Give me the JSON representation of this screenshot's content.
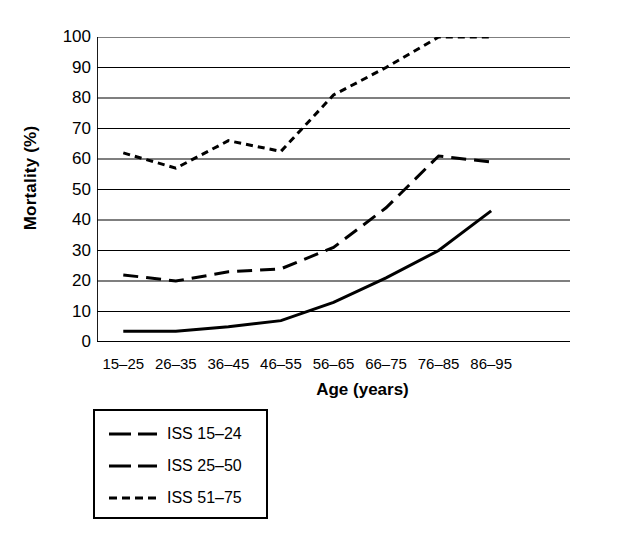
{
  "chart_data": {
    "type": "line",
    "title": "",
    "xlabel": "Age (years)",
    "ylabel": "Mortality (%)",
    "categories": [
      "15–25",
      "26–35",
      "36–45",
      "46–55",
      "56–65",
      "66–75",
      "76–85",
      "86–95"
    ],
    "ylim": [
      0,
      100
    ],
    "ytick_labels": [
      "0",
      "10",
      "20",
      "30",
      "40",
      "50",
      "60",
      "70",
      "80",
      "90",
      "100"
    ],
    "ytick_values": [
      0,
      10,
      20,
      30,
      40,
      50,
      60,
      70,
      80,
      90,
      100
    ],
    "grid": "horizontal",
    "legend_position": "below-left",
    "series": [
      {
        "name": "ISS 15–24",
        "style": "solid",
        "color": "#000000",
        "values": [
          3.5,
          3.5,
          5,
          7,
          13,
          21,
          30,
          43
        ]
      },
      {
        "name": "ISS 25–50",
        "style": "dashed",
        "color": "#000000",
        "values": [
          22,
          20,
          23,
          24,
          31,
          44,
          61,
          59
        ]
      },
      {
        "name": "ISS 51–75",
        "style": "dotted",
        "color": "#000000",
        "values": [
          62,
          57,
          66,
          62.5,
          81,
          90,
          100,
          100
        ]
      }
    ]
  },
  "axes": {
    "y_title": "Mortality (%)",
    "x_title": "Age (years)"
  },
  "legend": {
    "entries": [
      {
        "label": "ISS 15–24"
      },
      {
        "label": "ISS 25–50"
      },
      {
        "label": "ISS 51–75"
      }
    ]
  }
}
